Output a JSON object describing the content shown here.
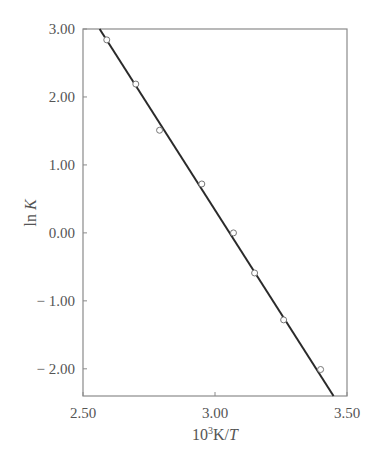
{
  "chart_data": {
    "type": "scatter",
    "title": "",
    "xlabel": "10³K/T",
    "xlabel_parts": {
      "base": "10",
      "sup": "3",
      "unit": "K/",
      "var": "T"
    },
    "ylabel": "ln K",
    "ylabel_parts": {
      "fn": "ln ",
      "var": "K"
    },
    "xlim": [
      2.5,
      3.5
    ],
    "ylim": [
      -2.4,
      3.0
    ],
    "x_ticks": [
      2.5,
      3.0,
      3.5
    ],
    "x_tick_labels": [
      "2.50",
      "3.00",
      "3.50"
    ],
    "y_ticks": [
      3.0,
      2.0,
      1.0,
      0.0,
      -1.0,
      -2.0
    ],
    "y_tick_labels": [
      "3.00",
      "2.00",
      "1.00",
      "0.00",
      "− 1.00",
      "− 2.00"
    ],
    "grid": false,
    "legend": "none",
    "series": [
      {
        "name": "measured",
        "marker": "open-circle",
        "x": [
          2.59,
          2.7,
          2.79,
          2.95,
          3.07,
          3.15,
          3.26,
          3.4
        ],
        "y": [
          2.84,
          2.19,
          1.51,
          0.72,
          0.0,
          -0.59,
          -1.28,
          -2.01
        ]
      }
    ],
    "fit_line": {
      "name": "linear fit",
      "x": [
        2.563,
        3.449
      ],
      "y": [
        3.0,
        -2.4
      ]
    }
  }
}
